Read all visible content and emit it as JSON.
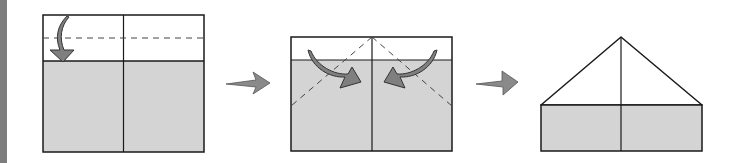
{
  "diagram": {
    "colors": {
      "paper_colored": "#d4d4d4",
      "paper_white": "#ffffff",
      "outline": "#1a1a1a",
      "arrow_fill": "#7f7f7f",
      "arrow_stroke": "#333333",
      "sidebar": "#7d7d7d"
    },
    "steps": [
      {
        "index": 1,
        "description": "Fold top edge down along dashed line",
        "fold_arrows": 1
      },
      {
        "index": 2,
        "description": "Fold top corners down to center along dashed diagonals",
        "fold_arrows": 2
      },
      {
        "index": 3,
        "description": "Result: house shape with triangular roof",
        "fold_arrows": 0
      }
    ],
    "transition_arrows": 2
  }
}
